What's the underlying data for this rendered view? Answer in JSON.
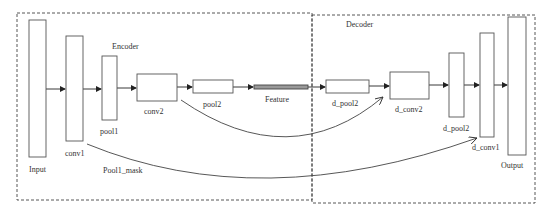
{
  "diagram": {
    "groups": [
      {
        "id": "encoder",
        "label": "Encoder",
        "x": 17,
        "y": 13,
        "w": 295,
        "h": 187,
        "label_x": 112,
        "label_y": 49
      },
      {
        "id": "decoder",
        "label": "Decoder",
        "x": 312,
        "y": 15,
        "w": 223,
        "h": 188,
        "label_x": 346,
        "label_y": 27
      }
    ],
    "blocks": [
      {
        "id": "input",
        "label": "Input",
        "x": 29,
        "y": 20,
        "w": 17,
        "h": 137,
        "label_x": 38,
        "label_y": 171
      },
      {
        "id": "conv1",
        "label": "conv1",
        "x": 66,
        "y": 36,
        "w": 17,
        "h": 105,
        "label_x": 75,
        "label_y": 156
      },
      {
        "id": "pool1",
        "label": "pool1",
        "x": 102,
        "y": 56,
        "w": 15,
        "h": 64,
        "label_x": 110,
        "label_y": 134
      },
      {
        "id": "conv2",
        "label": "conv2",
        "x": 137,
        "y": 74,
        "w": 40,
        "h": 27,
        "label_x": 156,
        "label_y": 114
      },
      {
        "id": "pool2",
        "label": "pool2",
        "x": 193,
        "y": 80,
        "w": 40,
        "h": 13,
        "label_x": 212,
        "label_y": 106
      },
      {
        "id": "feature",
        "label": "Feature",
        "x": 254,
        "y": 85,
        "w": 54,
        "h": 4,
        "label_x": 280,
        "label_y": 102,
        "filled": true
      },
      {
        "id": "d_pool2_a",
        "label": "d_pool2",
        "x": 326,
        "y": 80,
        "w": 43,
        "h": 13,
        "label_x": 346,
        "label_y": 106
      },
      {
        "id": "d_conv2",
        "label": "d_conv2",
        "x": 390,
        "y": 72,
        "w": 39,
        "h": 27,
        "label_x": 410,
        "label_y": 112
      },
      {
        "id": "d_pool2_b",
        "label": "d_pool2",
        "x": 449,
        "y": 53,
        "w": 15,
        "h": 64,
        "label_x": 457,
        "label_y": 131
      },
      {
        "id": "d_conv1",
        "label": "d_conv1",
        "x": 480,
        "y": 33,
        "w": 14,
        "h": 104,
        "label_x": 487,
        "label_y": 150
      },
      {
        "id": "output",
        "label": "Output",
        "x": 508,
        "y": 17,
        "w": 18,
        "h": 138,
        "label_x": 514,
        "label_y": 168
      }
    ],
    "arrows": [
      {
        "from": "input",
        "to": "conv1",
        "y": 89,
        "x1": 46,
        "x2": 66
      },
      {
        "from": "conv1",
        "to": "pool1",
        "y": 89,
        "x1": 83,
        "x2": 102
      },
      {
        "from": "pool1",
        "to": "conv2",
        "y": 88,
        "x1": 117,
        "x2": 137
      },
      {
        "from": "conv2",
        "to": "pool2",
        "y": 87,
        "x1": 177,
        "x2": 193
      },
      {
        "from": "pool2",
        "to": "feature",
        "y": 87,
        "x1": 233,
        "x2": 254
      },
      {
        "from": "feature",
        "to": "d_pool2_a",
        "y": 87,
        "x1": 308,
        "x2": 326
      },
      {
        "from": "d_pool2_a",
        "to": "d_conv2",
        "y": 86,
        "x1": 369,
        "x2": 390
      },
      {
        "from": "d_conv2",
        "to": "d_pool2_b",
        "y": 85,
        "x1": 429,
        "x2": 449
      },
      {
        "from": "d_pool2_b",
        "to": "d_conv1",
        "y": 85,
        "x1": 464,
        "x2": 480
      },
      {
        "from": "d_conv1",
        "to": "output",
        "y": 85,
        "x1": 494,
        "x2": 508
      }
    ],
    "skip_connections": [
      {
        "id": "pool2_mask",
        "from": "conv2",
        "to": "d_conv2",
        "path": "M 181 100 Q 290 175 383 97",
        "label": ""
      },
      {
        "id": "pool1_mask",
        "from": "conv1",
        "to": "d_conv1",
        "path": "M 87 144 Q 260 215 477 138",
        "label": "Pool1_mask",
        "label_x": 130,
        "label_y": 172
      }
    ]
  },
  "labels": {
    "encoder": "Encoder",
    "decoder": "Decoder",
    "input": "Input",
    "conv1": "conv1",
    "pool1": "pool1",
    "conv2": "conv2",
    "pool2": "pool2",
    "feature": "Feature",
    "d_pool2_a": "d_pool2",
    "d_conv2": "d_conv2",
    "d_pool2_b": "d_pool2",
    "d_conv1": "d_conv1",
    "output": "Output",
    "pool1_mask": "Pool1_mask"
  },
  "colors": {
    "stroke": "#555555",
    "dash": "#444444",
    "text": "#333333",
    "feature_fill": "#999999",
    "background": "#ffffff"
  }
}
